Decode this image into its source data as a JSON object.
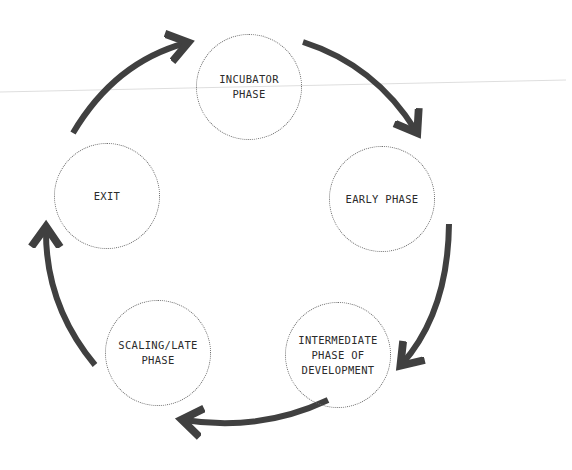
{
  "diagram": {
    "type": "cycle",
    "colors": {
      "arrow": "#404040",
      "circle_border": "#6a6a6a",
      "text": "#2b2b2b",
      "guide_line": "#dedede",
      "background": "#ffffff"
    },
    "nodes": [
      {
        "id": "incubator",
        "label": "INCUBATOR\nPHASE",
        "cx": 249,
        "cy": 87
      },
      {
        "id": "early",
        "label": "EARLY PHASE",
        "cx": 382,
        "cy": 199
      },
      {
        "id": "intermediate",
        "label": "INTERMEDIATE\nPHASE OF\nDEVELOPMENT",
        "cx": 338,
        "cy": 355
      },
      {
        "id": "scaling",
        "label": "SCALING/LATE\nPHASE",
        "cx": 158,
        "cy": 353
      },
      {
        "id": "exit",
        "label": "EXIT",
        "cx": 107,
        "cy": 196
      }
    ],
    "edges": [
      {
        "from": "exit",
        "to": "incubator"
      },
      {
        "from": "incubator",
        "to": "early"
      },
      {
        "from": "early",
        "to": "intermediate"
      },
      {
        "from": "intermediate",
        "to": "scaling"
      },
      {
        "from": "scaling",
        "to": "exit"
      }
    ]
  }
}
